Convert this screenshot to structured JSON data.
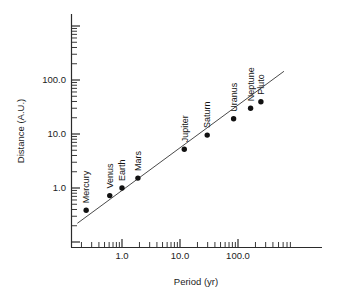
{
  "chart_data": {
    "type": "scatter",
    "title": "",
    "xlabel": "Period (yr)",
    "ylabel": "Distance (A.U.)",
    "xscale": "log",
    "yscale": "log",
    "xlim": [
      0.15,
      800
    ],
    "ylim": [
      0.2,
      400
    ],
    "grid": false,
    "legend": null,
    "x_tick_labels": [
      "1.0",
      "10.0",
      "100.0"
    ],
    "x_tick_values": [
      1.0,
      10.0,
      100.0
    ],
    "y_tick_labels": [
      "1.0",
      "10.0",
      "100.0"
    ],
    "y_tick_values": [
      1.0,
      10.0,
      100.0
    ],
    "point_label_rotation": -90,
    "series": [
      {
        "name": "Planets",
        "marker": "filled-circle",
        "labels": [
          "Mercury",
          "Venus",
          "Earth",
          "Mars",
          "Jupiter",
          "Saturn",
          "Uranus",
          "Neptune",
          "Pluto"
        ],
        "x": [
          0.241,
          0.615,
          1.0,
          1.881,
          11.86,
          29.46,
          84.01,
          164.8,
          248.1
        ],
        "y": [
          0.387,
          0.723,
          1.0,
          1.524,
          5.203,
          9.539,
          19.19,
          30.06,
          39.53
        ]
      }
    ],
    "fit_line": {
      "name": "Kepler third law fit",
      "slope_loglog": 0.667,
      "x_start": 0.17,
      "y_start": 0.222,
      "x_end": 620,
      "y_end": 145
    },
    "annotations": []
  },
  "figure": {
    "background": "#ffffff",
    "axis_color": "#2b2b2b",
    "marker_color": "#111111",
    "line_color": "#4a4a4a",
    "xaxis_title": "Period (yr)",
    "yaxis_title": "Distance (A.U.)"
  }
}
